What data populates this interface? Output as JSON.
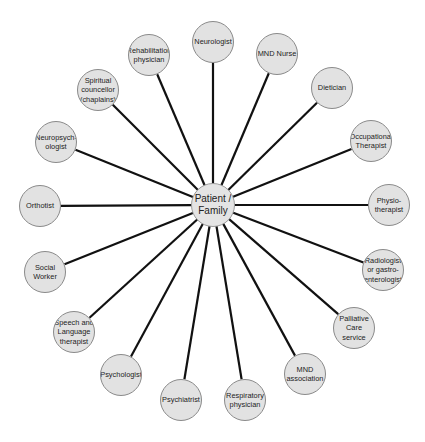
{
  "diagram": {
    "type": "hub-and-spoke",
    "center": {
      "label": "Patient /\nFamily",
      "x": 213,
      "y": 205,
      "r": 22
    },
    "nodes": [
      {
        "id": "neurologist",
        "label": "Neurologist",
        "x": 213,
        "y": 42,
        "r": 21
      },
      {
        "id": "mnd-nurse",
        "label": "MND Nurse",
        "x": 277,
        "y": 54,
        "r": 21
      },
      {
        "id": "dietician",
        "label": "Dietician",
        "x": 332,
        "y": 88,
        "r": 21
      },
      {
        "id": "occupational-therapist",
        "label": "Occupational\nTherapist",
        "x": 371,
        "y": 141,
        "r": 21
      },
      {
        "id": "physiotherapist",
        "label": "Physio-\ntherapist",
        "x": 389,
        "y": 205,
        "r": 21
      },
      {
        "id": "radiologist",
        "label": "Radiologist\nor gastro-\nenterologist",
        "x": 383,
        "y": 270,
        "r": 21
      },
      {
        "id": "palliative-care",
        "label": "Palliative\nCare service",
        "x": 354,
        "y": 328,
        "r": 21
      },
      {
        "id": "mnd-association",
        "label": "MND\nassociation",
        "x": 305,
        "y": 374,
        "r": 21
      },
      {
        "id": "respiratory-physician",
        "label": "Respiratory\nphysician",
        "x": 245,
        "y": 400,
        "r": 21
      },
      {
        "id": "psychiatrist",
        "label": "Psychiatrist",
        "x": 181,
        "y": 400,
        "r": 21
      },
      {
        "id": "psychologist",
        "label": "Psychologist",
        "x": 121,
        "y": 375,
        "r": 21
      },
      {
        "id": "speech-language-therapist",
        "label": "Speech and\nLanguage\ntherapist",
        "x": 74,
        "y": 332,
        "r": 21
      },
      {
        "id": "social-worker",
        "label": "Social\nWorker",
        "x": 45,
        "y": 272,
        "r": 21
      },
      {
        "id": "orthotist",
        "label": "Orthotist",
        "x": 40,
        "y": 206,
        "r": 21
      },
      {
        "id": "neuropsychologist",
        "label": "Neuropsych-\nologist",
        "x": 56,
        "y": 142,
        "r": 21
      },
      {
        "id": "spiritual-councellor",
        "label": "Spiritual\ncouncellor\n(chaplains)",
        "x": 98,
        "y": 90,
        "r": 21
      },
      {
        "id": "rehabilitation-physician",
        "label": "Rehabilitation\nphysician",
        "x": 149,
        "y": 55,
        "r": 21
      }
    ],
    "colors": {
      "node_fill": "#e2e2e2",
      "node_border": "#8a8a8a",
      "connector": "#111111",
      "text": "#222222"
    }
  }
}
